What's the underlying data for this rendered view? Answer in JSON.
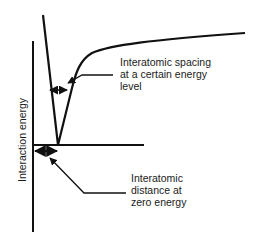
{
  "diagram": {
    "title": "",
    "y_axis_label": "Interaction energy",
    "annotations": [
      {
        "id": "spacing",
        "text_lines": [
          "Interatomic spacing",
          "at a certain energy",
          "level"
        ]
      },
      {
        "id": "zero",
        "text_lines": [
          "Interatomic",
          "distance at",
          "zero energy"
        ]
      }
    ],
    "colors": {
      "line": "#111111",
      "background": "#ffffff"
    }
  }
}
